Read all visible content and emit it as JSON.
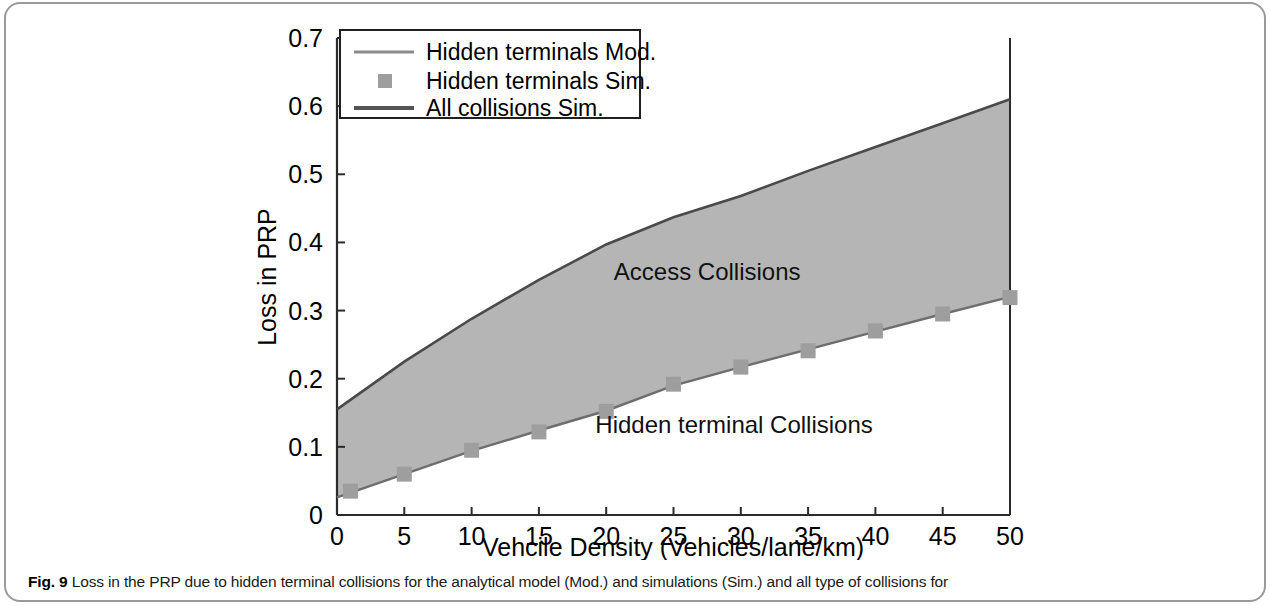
{
  "figure": {
    "caption_label": "Fig. 9",
    "caption_text": " Loss in the PRP due to hidden terminal collisions for the analytical model (Mod.) and simulations (Sim.) and all type of collisions for"
  },
  "legend": {
    "items": [
      {
        "label": "Hidden terminals Mod.",
        "marker": "line",
        "color": "#8c8c8c"
      },
      {
        "label": "Hidden terminals Sim.",
        "marker": "square",
        "color": "#9e9e9e"
      },
      {
        "label": "All collisions Sim.",
        "marker": "line",
        "color": "#555555"
      }
    ]
  },
  "annotations": [
    {
      "text": "Access Collisions",
      "x": 27.5,
      "y": 0.345
    },
    {
      "text": "Hidden terminal Collisions",
      "x": 29.5,
      "y": 0.12
    }
  ],
  "colors": {
    "band_fill": "#b5b5b5",
    "upper_line": "#4a4a4a",
    "lower_line": "#6e6e6e",
    "marker": "#9e9e9e",
    "axis": "#2b2b2b",
    "frame": "#9a9a9a"
  },
  "chart_data": {
    "type": "area",
    "title": "",
    "xlabel": "Vehcile Density (Vehicles/lane/km)",
    "ylabel": "Loss in PRP",
    "xlim": [
      0,
      50
    ],
    "ylim": [
      0,
      0.7
    ],
    "xticks": [
      0,
      5,
      10,
      15,
      20,
      25,
      30,
      35,
      40,
      45,
      50
    ],
    "xtick_labels": [
      "0",
      "5",
      "10",
      "15",
      "20",
      "25",
      "30",
      "35",
      "40",
      "45",
      "50"
    ],
    "yticks": [
      0,
      0.1,
      0.2,
      0.3,
      0.4,
      0.5,
      0.6,
      0.7
    ],
    "ytick_labels": [
      "0",
      "0.1",
      "0.2",
      "0.3",
      "0.4",
      "0.5",
      "0.6",
      "0.7"
    ],
    "grid": false,
    "legend_position": "upper-left",
    "series": [
      {
        "name": "Hidden terminals Mod.",
        "style": "line",
        "x": [
          0,
          5,
          10,
          15,
          20,
          25,
          30,
          35,
          40,
          45,
          50
        ],
        "values": [
          0.026,
          0.06,
          0.094,
          0.124,
          0.153,
          0.19,
          0.217,
          0.243,
          0.269,
          0.295,
          0.32
        ]
      },
      {
        "name": "Hidden terminals Sim.",
        "style": "markers",
        "x": [
          1,
          5,
          10,
          15,
          20,
          25,
          30,
          35,
          40,
          45,
          50
        ],
        "values": [
          0.035,
          0.06,
          0.095,
          0.122,
          0.152,
          0.192,
          0.217,
          0.241,
          0.27,
          0.295,
          0.319
        ]
      },
      {
        "name": "All collisions Sim.",
        "style": "line",
        "x": [
          0,
          5,
          10,
          15,
          20,
          25,
          30,
          35,
          40,
          45,
          50
        ],
        "values": [
          0.155,
          0.225,
          0.288,
          0.345,
          0.397,
          0.437,
          0.468,
          0.505,
          0.54,
          0.575,
          0.61
        ]
      }
    ],
    "band": {
      "name": "Access Collisions region",
      "lower_series": "Hidden terminals Mod.",
      "upper_series": "All collisions Sim.",
      "fill": "#b5b5b5"
    }
  }
}
